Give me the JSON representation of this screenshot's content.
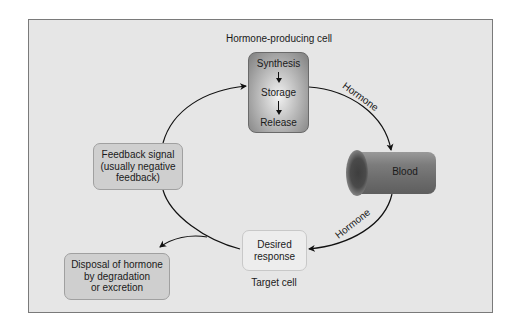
{
  "diagram": {
    "type": "hormone feedback loop",
    "background_color": "#e6e6e6",
    "nodes": {
      "producing_cell": {
        "caption": "Hormone-producing cell",
        "steps": [
          "Synthesis",
          "Storage",
          "Release"
        ]
      },
      "blood": {
        "label": "Blood"
      },
      "target": {
        "lines": [
          "Desired",
          "response"
        ],
        "caption": "Target cell"
      },
      "feedback": {
        "lines": [
          "Feedback signal",
          "(usually negative",
          "feedback)"
        ]
      },
      "disposal": {
        "lines": [
          "Disposal of hormone",
          "by degradation",
          "or excretion"
        ]
      }
    },
    "edges": [
      {
        "from": "producing_cell",
        "to": "blood",
        "label": "Hormone"
      },
      {
        "from": "blood",
        "to": "target",
        "label": "Hormone"
      },
      {
        "from": "target",
        "to": "feedback",
        "label": ""
      },
      {
        "from": "feedback",
        "to": "producing_cell",
        "label": ""
      },
      {
        "from": "loop",
        "to": "disposal",
        "label": ""
      }
    ]
  }
}
